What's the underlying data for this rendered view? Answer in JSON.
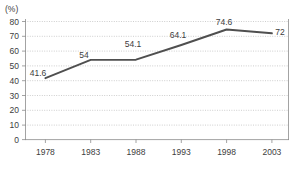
{
  "chart_data": {
    "type": "line",
    "title": "",
    "xlabel": "",
    "ylabel": "",
    "unit_label": "(%)",
    "categories": [
      "1978",
      "1983",
      "1988",
      "1993",
      "1998",
      "2003"
    ],
    "values": [
      41.6,
      54,
      54.1,
      64.1,
      74.6,
      72
    ],
    "point_labels": [
      "41.6",
      "54",
      "54.1",
      "64.1",
      "74.6",
      "72"
    ],
    "ylim": [
      0,
      80
    ],
    "ytick_labels": [
      "80",
      "70",
      "60",
      "50",
      "40",
      "30",
      "20",
      "10",
      "0"
    ],
    "ytick_values": [
      80,
      70,
      60,
      50,
      40,
      30,
      20,
      10,
      0
    ],
    "grid": "horizontal-dotted",
    "legend": "none",
    "series": [
      {
        "name": "series-1",
        "color": "#4f4f4f",
        "values": [
          41.6,
          54,
          54.1,
          64.1,
          74.6,
          72
        ]
      }
    ]
  },
  "colors": {
    "line": "#4f4f4f",
    "grid": "#b9b9b9",
    "axis": "#8c8c8c",
    "text": "#3d3d3d",
    "background": "#ffffff"
  },
  "footer": {
    "cropped_text": ""
  }
}
